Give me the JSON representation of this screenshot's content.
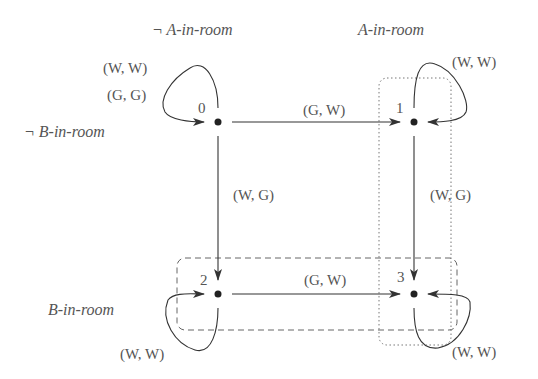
{
  "diagram": {
    "type": "state-transition",
    "regions": {
      "not_a_in_room": "¬ A-in-room",
      "a_in_room": "A-in-room",
      "not_b_in_room": "¬ B-in-room",
      "b_in_room": "B-in-room"
    },
    "states": [
      {
        "id": "0",
        "label": "0"
      },
      {
        "id": "1",
        "label": "1"
      },
      {
        "id": "2",
        "label": "2"
      },
      {
        "id": "3",
        "label": "3"
      }
    ],
    "transitions": {
      "s0_self_a": "(W, W)",
      "s0_self_b": "(G, G)",
      "s0_to_s1": "(G, W)",
      "s0_to_s2": "(W, G)",
      "s1_self": "(W, W)",
      "s1_to_s3": "(W, G)",
      "s2_to_s3": "(G, W)",
      "s2_self": "(W, W)",
      "s3_self": "(W, W)"
    },
    "colors": {
      "line": "#333333",
      "text": "#555555"
    }
  }
}
